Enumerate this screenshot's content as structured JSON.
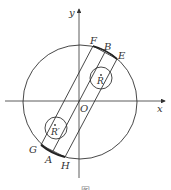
{
  "diagram": {
    "axes": {
      "x_label": "x",
      "y_label": "y",
      "origin_label": "O"
    },
    "points": {
      "F": "F",
      "B": "B",
      "E": "E",
      "G": "G",
      "A": "A",
      "H": "H"
    },
    "circles": {
      "upper_center_label": "R",
      "lower_center_label": "R′"
    },
    "caption": "图"
  },
  "colors": {
    "stroke": "#333333",
    "background": "#ffffff"
  }
}
